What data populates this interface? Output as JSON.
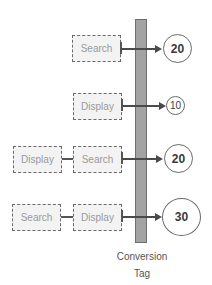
{
  "diagram": {
    "tag_label_line1": "Conversion",
    "tag_label_line2": "Tag",
    "rows": [
      {
        "channels": [
          "Search"
        ],
        "value": "20"
      },
      {
        "channels": [
          "Display"
        ],
        "value": "10"
      },
      {
        "channels": [
          "Display",
          "Search"
        ],
        "value": "20"
      },
      {
        "channels": [
          "Search",
          "Display"
        ],
        "value": "30"
      }
    ]
  },
  "colors": {
    "bar_fill": "#a3a3a3",
    "box_border": "#6a6a6a",
    "box_text": "#9a9a9a",
    "arrow": "#4a4a4a"
  }
}
